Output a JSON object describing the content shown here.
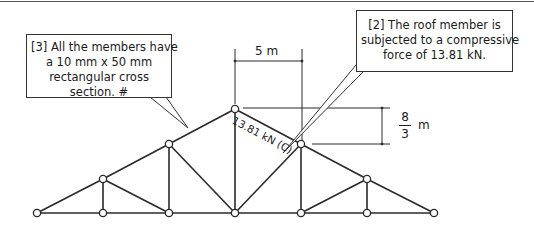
{
  "diagram": {
    "type": "roof truss",
    "callouts": [
      {
        "id": "3",
        "lines": [
          "[3] All the members have",
          "a 10 mm x 50 mm",
          "rectangular cross",
          "section. #"
        ]
      },
      {
        "id": "2",
        "lines": [
          "[2] The roof member is",
          "subjected to a compressive",
          "force of 13.81 kN."
        ]
      }
    ],
    "dimensions": {
      "horizontal": "5 m",
      "vertical_numerator": "8",
      "vertical_denominator": "3",
      "vertical_unit": "m"
    },
    "member_label": "13.81 kN (C)",
    "nodes": [
      {
        "id": "A",
        "x": 37,
        "y": 213
      },
      {
        "id": "B",
        "x": 103,
        "y": 213
      },
      {
        "id": "C",
        "x": 169,
        "y": 213
      },
      {
        "id": "D",
        "x": 235,
        "y": 213
      },
      {
        "id": "E",
        "x": 301,
        "y": 213
      },
      {
        "id": "F",
        "x": 367,
        "y": 213
      },
      {
        "id": "G",
        "x": 434,
        "y": 213
      },
      {
        "id": "H",
        "x": 103,
        "y": 179
      },
      {
        "id": "I",
        "x": 169,
        "y": 144
      },
      {
        "id": "J",
        "x": 235,
        "y": 109
      },
      {
        "id": "K",
        "x": 301,
        "y": 144
      },
      {
        "id": "L",
        "x": 367,
        "y": 179
      }
    ],
    "members": [
      [
        "A",
        "B"
      ],
      [
        "B",
        "C"
      ],
      [
        "C",
        "D"
      ],
      [
        "D",
        "E"
      ],
      [
        "E",
        "F"
      ],
      [
        "F",
        "G"
      ],
      [
        "A",
        "H"
      ],
      [
        "H",
        "I"
      ],
      [
        "I",
        "J"
      ],
      [
        "J",
        "K"
      ],
      [
        "K",
        "L"
      ],
      [
        "L",
        "G"
      ],
      [
        "B",
        "H"
      ],
      [
        "H",
        "C"
      ],
      [
        "C",
        "I"
      ],
      [
        "I",
        "D"
      ],
      [
        "D",
        "J"
      ],
      [
        "D",
        "K"
      ],
      [
        "K",
        "E"
      ],
      [
        "E",
        "L"
      ],
      [
        "L",
        "F"
      ]
    ],
    "colors": {
      "line": "#2a2a2a",
      "node_fill": "#ffffff",
      "text": "#1a1a1a",
      "background": "#ffffff"
    }
  }
}
